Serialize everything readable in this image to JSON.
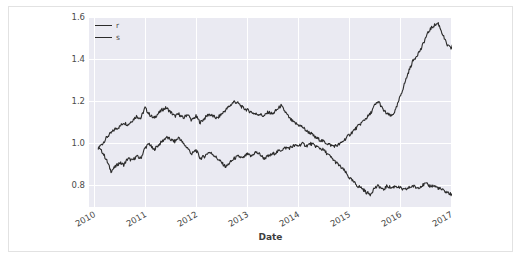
{
  "figure": {
    "background_color": "#ffffff",
    "border_color": "#e2e2e2",
    "plot_background_color": "#eaeaf2",
    "grid_color": "#ffffff",
    "line_color": "#2b2b2b"
  },
  "axes": {
    "xlabel": "Date",
    "ylabel": "",
    "ytick_labels": [
      "1.6",
      "1.4",
      "1.2",
      "1.0",
      "0.8"
    ],
    "xtick_labels": [
      "2010",
      "2011",
      "2012",
      "2013",
      "2014",
      "2015",
      "2016",
      "2017"
    ]
  },
  "legend": {
    "position": "upper-left",
    "entries": [
      {
        "label": "r",
        "color": "#2b2b2b"
      },
      {
        "label": "s",
        "color": "#2b2b2b"
      }
    ]
  },
  "chart_data": {
    "type": "line",
    "title": "",
    "xlabel": "Date",
    "ylabel": "",
    "xlim": [
      "2010-01-01",
      "2017-03-01"
    ],
    "ylim": [
      0.72,
      1.62
    ],
    "yticks": [
      0.8,
      1.0,
      1.2,
      1.4,
      1.6
    ],
    "xticks": [
      "2010",
      "2011",
      "2012",
      "2013",
      "2014",
      "2015",
      "2016",
      "2017"
    ],
    "grid": true,
    "legend_position": "upper left",
    "x": [
      "2010-02",
      "2010-03",
      "2010-04",
      "2010-05",
      "2010-06",
      "2010-07",
      "2010-08",
      "2010-09",
      "2010-10",
      "2010-11",
      "2010-12",
      "2011-01",
      "2011-02",
      "2011-03",
      "2011-04",
      "2011-05",
      "2011-06",
      "2011-07",
      "2011-08",
      "2011-09",
      "2011-10",
      "2011-11",
      "2011-12",
      "2012-01",
      "2012-02",
      "2012-03",
      "2012-04",
      "2012-05",
      "2012-06",
      "2012-07",
      "2012-08",
      "2012-09",
      "2012-10",
      "2012-11",
      "2012-12",
      "2013-01",
      "2013-02",
      "2013-03",
      "2013-04",
      "2013-05",
      "2013-06",
      "2013-07",
      "2013-08",
      "2013-09",
      "2013-10",
      "2013-11",
      "2013-12",
      "2014-01",
      "2014-02",
      "2014-03",
      "2014-04",
      "2014-05",
      "2014-06",
      "2014-07",
      "2014-08",
      "2014-09",
      "2014-10",
      "2014-11",
      "2014-12",
      "2015-01",
      "2015-02",
      "2015-03",
      "2015-04",
      "2015-05",
      "2015-06",
      "2015-07",
      "2015-08",
      "2015-09",
      "2015-10",
      "2015-11",
      "2015-12",
      "2016-01",
      "2016-02",
      "2016-03",
      "2016-04",
      "2016-05",
      "2016-06",
      "2016-07",
      "2016-08",
      "2016-09",
      "2016-10",
      "2016-11",
      "2016-12",
      "2017-01",
      "2017-02"
    ],
    "series": [
      {
        "name": "r",
        "color": "#2b2b2b",
        "values": [
          1.0,
          1.02,
          1.05,
          1.07,
          1.09,
          1.1,
          1.12,
          1.11,
          1.13,
          1.15,
          1.14,
          1.19,
          1.16,
          1.14,
          1.16,
          1.18,
          1.19,
          1.17,
          1.15,
          1.16,
          1.14,
          1.16,
          1.13,
          1.15,
          1.12,
          1.14,
          1.16,
          1.15,
          1.14,
          1.16,
          1.18,
          1.2,
          1.22,
          1.21,
          1.19,
          1.18,
          1.17,
          1.16,
          1.16,
          1.15,
          1.17,
          1.16,
          1.18,
          1.2,
          1.17,
          1.14,
          1.12,
          1.11,
          1.1,
          1.08,
          1.07,
          1.05,
          1.04,
          1.03,
          1.02,
          1.01,
          1.01,
          1.02,
          1.04,
          1.06,
          1.08,
          1.1,
          1.12,
          1.14,
          1.16,
          1.2,
          1.22,
          1.18,
          1.16,
          1.15,
          1.18,
          1.24,
          1.3,
          1.36,
          1.41,
          1.44,
          1.47,
          1.52,
          1.56,
          1.58,
          1.59,
          1.54,
          1.49,
          1.47,
          1.52
        ]
      },
      {
        "name": "s",
        "color": "#2b2b2b",
        "values": [
          1.0,
          0.98,
          0.94,
          0.89,
          0.91,
          0.93,
          0.92,
          0.95,
          0.94,
          0.96,
          0.95,
          1.0,
          1.02,
          0.99,
          1.01,
          1.03,
          1.05,
          1.04,
          1.03,
          1.05,
          1.02,
          1.0,
          0.97,
          0.99,
          0.95,
          0.96,
          0.98,
          0.97,
          0.95,
          0.93,
          0.91,
          0.93,
          0.95,
          0.96,
          0.95,
          0.97,
          0.96,
          0.98,
          0.97,
          0.95,
          0.96,
          0.97,
          0.98,
          0.99,
          1.0,
          1.0,
          1.01,
          1.01,
          1.02,
          1.01,
          1.02,
          1.01,
          1.0,
          0.99,
          0.97,
          0.95,
          0.93,
          0.91,
          0.89,
          0.86,
          0.84,
          0.82,
          0.81,
          0.79,
          0.78,
          0.81,
          0.82,
          0.8,
          0.82,
          0.81,
          0.82,
          0.81,
          0.8,
          0.81,
          0.82,
          0.81,
          0.82,
          0.83,
          0.82,
          0.82,
          0.81,
          0.8,
          0.79,
          0.78,
          0.77
        ]
      }
    ]
  }
}
